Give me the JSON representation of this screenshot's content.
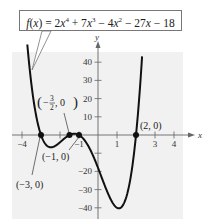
{
  "chart_data": {
    "type": "line",
    "equation": {
      "lhs": "f(x) = ",
      "terms": [
        "2x^4",
        "+ 7x^3",
        "- 4x^2",
        "- 27x",
        "- 18"
      ]
    },
    "xlabel": "x",
    "ylabel": "y",
    "xlim": [
      -4.5,
      5
    ],
    "ylim": [
      -45,
      45
    ],
    "grid": false,
    "legend": null,
    "x_ticks": [
      -4,
      -3,
      -2,
      -1,
      1,
      2,
      3,
      4
    ],
    "x_tick_labels": [
      {
        "value": -4,
        "label": "−4"
      },
      {
        "value": -1,
        "label": "−1"
      },
      {
        "value": 1,
        "label": "1"
      },
      {
        "value": 3,
        "label": "3"
      },
      {
        "value": 4,
        "label": "4"
      }
    ],
    "y_ticks": [
      40,
      30,
      20,
      10,
      -10,
      -20,
      -30,
      -40
    ],
    "y_tick_labels": [
      {
        "value": 40,
        "label": "40"
      },
      {
        "value": 30,
        "label": "30"
      },
      {
        "value": 20,
        "label": "20"
      },
      {
        "value": 10,
        "label": "10"
      },
      {
        "value": -20,
        "label": "−20"
      },
      {
        "value": -30,
        "label": "−30"
      },
      {
        "value": -40,
        "label": "−40"
      }
    ],
    "coefficients": [
      2,
      7,
      -4,
      -27,
      -18
    ],
    "x_range": [
      -3.72,
      2.32
    ],
    "series": [
      {
        "name": "f(x)",
        "x": [
          -3.7,
          -3.5,
          -3.3,
          -3,
          -2.5,
          -2,
          -1.5,
          -1.25,
          -1,
          0,
          1,
          1.25,
          1.5,
          2,
          2.3
        ],
        "y": [
          47.3,
          27.5,
          13.1,
          0,
          -6.8,
          -4,
          0,
          0.7,
          0,
          -18,
          -40,
          -39.5,
          -33.8,
          0,
          39.9
        ]
      }
    ],
    "annotations": [
      {
        "point": [
          -3,
          0
        ],
        "label": "(−3, 0)"
      },
      {
        "point": [
          -1.5,
          0
        ],
        "label": "(−¾⁄, 0)",
        "label_parts": {
          "sign": "−",
          "num": "3",
          "den": "2",
          "rest": ", 0"
        }
      },
      {
        "point": [
          -1,
          0
        ],
        "label": "(−1, 0)"
      },
      {
        "point": [
          2,
          0
        ],
        "label": "(2, 0)"
      }
    ]
  },
  "colors": {
    "curve": "#111111",
    "axis": "#666666",
    "plot_bg": "#f1f1f1",
    "text": "#222222"
  }
}
